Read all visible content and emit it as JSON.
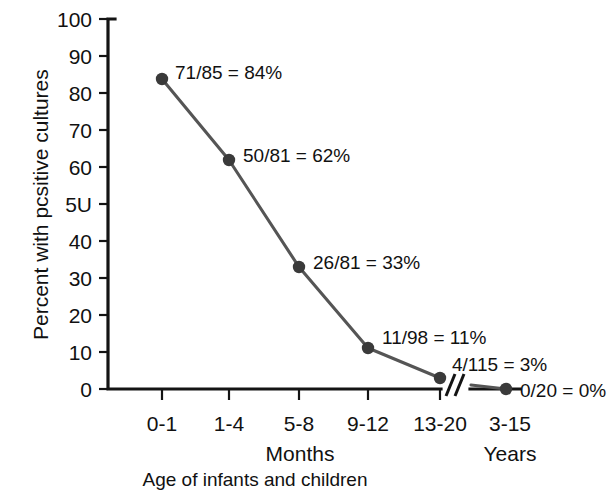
{
  "chart_data": {
    "type": "line",
    "title": "",
    "subtitle": "",
    "xlabel": "Age of infants and children",
    "ylabel": "Percent with pcsitive cultures",
    "categories": [
      "0-1",
      "1-4",
      "5-8",
      "9-12",
      "13-20",
      "3-15"
    ],
    "group_labels": [
      {
        "text": "Months",
        "spans": [
          "0-1",
          "1-4",
          "5-8",
          "9-12",
          "13-20"
        ]
      },
      {
        "text": "Years",
        "spans": [
          "3-15"
        ]
      }
    ],
    "series": [
      {
        "name": "Percent with positive cultures",
        "values": [
          84,
          62,
          33,
          11,
          3,
          0
        ],
        "point_labels": [
          "71/85 = 84%",
          "50/81 = 62%",
          "26/81 = 33%",
          "11/98 = 11%",
          "4/115 = 3%",
          "0/20 = 0%"
        ],
        "numerators": [
          71,
          50,
          26,
          11,
          4,
          0
        ],
        "denominators": [
          85,
          81,
          81,
          98,
          115,
          20
        ],
        "color": "#555555",
        "marker_color": "#3a3a3a"
      }
    ],
    "ylim": [
      0,
      100
    ],
    "ytick_labels": [
      "0",
      "10",
      "20",
      "30",
      "40",
      "5U",
      "60",
      "70",
      "80",
      "90",
      "100"
    ],
    "ytick_values": [
      0,
      10,
      20,
      30,
      40,
      50,
      60,
      70,
      80,
      90,
      100
    ],
    "grid": false,
    "legend": false,
    "legend_position": "none",
    "axis_break": {
      "present": true,
      "between": [
        "13-20",
        "3-15"
      ],
      "symbol": "double-slash"
    },
    "colors": {
      "background": "#ffffff",
      "axis": "#141414",
      "text": "#111111",
      "line": "#555555",
      "marker": "#3a3a3a"
    }
  }
}
